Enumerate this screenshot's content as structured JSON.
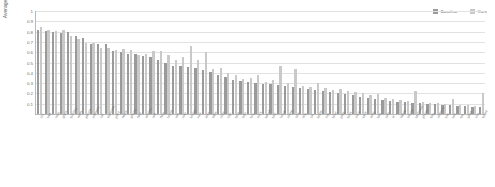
{
  "chart_data": {
    "type": "bar",
    "title": "",
    "xlabel": "",
    "ylabel": "Average Precision",
    "ylim": [
      0,
      1
    ],
    "yticks": [
      "1",
      "0.9",
      "0.8",
      "0.7",
      "0.6",
      "0.5",
      "0.4",
      "0.3",
      "0.2",
      "0.1"
    ],
    "grid": true,
    "legend_position": "top-right",
    "legend": [
      "Baseline",
      "Ours"
    ],
    "colors": {
      "baseline": "#9a9a9a",
      "ours": "#c9c9c9",
      "grid": "#e2e2e2",
      "axis": "#b9b9b9"
    },
    "categories": [
      "sky",
      "tree",
      "road",
      "grass",
      "building",
      "water",
      "person",
      "sidewalk",
      "car",
      "mountain",
      "plant",
      "fence",
      "ground",
      "field",
      "window",
      "wall",
      "floor",
      "house",
      "sea",
      "river",
      "bridge",
      "rock",
      "door",
      "table",
      "chair",
      "sign",
      "boat",
      "train",
      "bus",
      "truck",
      "bench",
      "bird",
      "horse",
      "sheep",
      "cow",
      "dog",
      "cat",
      "bottle",
      "cup",
      "bowl",
      "plate",
      "book",
      "clock",
      "vase",
      "lamp",
      "bed",
      "sofa",
      "tv",
      "laptop",
      "mouse",
      "keyboard",
      "phone",
      "bag",
      "umbrella",
      "kite",
      "ball",
      "bat",
      "glove",
      "skis",
      "board"
    ],
    "series": [
      {
        "name": "Baseline",
        "values": [
          0.82,
          0.81,
          0.8,
          0.79,
          0.8,
          0.76,
          0.74,
          0.68,
          0.68,
          0.68,
          0.61,
          0.6,
          0.58,
          0.58,
          0.56,
          0.55,
          0.52,
          0.5,
          0.47,
          0.47,
          0.46,
          0.45,
          0.43,
          0.41,
          0.38,
          0.36,
          0.33,
          0.32,
          0.31,
          0.3,
          0.29,
          0.29,
          0.28,
          0.27,
          0.26,
          0.25,
          0.24,
          0.23,
          0.22,
          0.21,
          0.2,
          0.19,
          0.18,
          0.17,
          0.16,
          0.15,
          0.14,
          0.13,
          0.12,
          0.12,
          0.11,
          0.11,
          0.1,
          0.1,
          0.09,
          0.09,
          0.08,
          0.08,
          0.07,
          0.07
        ]
      },
      {
        "name": "Ours",
        "values": [
          0.84,
          0.82,
          0.81,
          0.82,
          0.76,
          0.73,
          0.69,
          0.69,
          0.64,
          0.64,
          0.62,
          0.63,
          0.62,
          0.57,
          0.58,
          0.61,
          0.61,
          0.57,
          0.52,
          0.55,
          0.66,
          0.52,
          0.6,
          0.44,
          0.45,
          0.4,
          0.38,
          0.34,
          0.35,
          0.38,
          0.31,
          0.33,
          0.47,
          0.3,
          0.44,
          0.27,
          0.26,
          0.3,
          0.25,
          0.23,
          0.24,
          0.22,
          0.21,
          0.2,
          0.18,
          0.19,
          0.16,
          0.15,
          0.14,
          0.13,
          0.22,
          0.12,
          0.11,
          0.11,
          0.1,
          0.15,
          0.09,
          0.09,
          0.08,
          0.2
        ]
      }
    ]
  }
}
